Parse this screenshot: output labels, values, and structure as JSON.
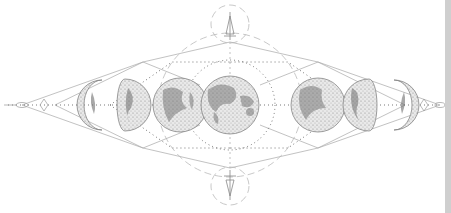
{
  "illustration": {
    "subject": "moon phases with sacred geometry",
    "colors": {
      "background": "#ffffff",
      "line": "#9a9a9a",
      "dots": "#555555",
      "moon_fill": "#e4e4e4",
      "moon_dark": "#6e6e6e",
      "moon_edge": "#777777",
      "edge_strip": "#cfcfcf"
    },
    "center_y": 105,
    "moons": [
      {
        "phase": "waxing-crescent",
        "cx": 96,
        "r": 25
      },
      {
        "phase": "first-quarter",
        "cx": 132,
        "r": 26
      },
      {
        "phase": "waxing-gibbous",
        "cx": 180,
        "r": 27
      },
      {
        "phase": "full-moon",
        "cx": 230,
        "r": 29
      },
      {
        "phase": "waning-gibbous",
        "cx": 318,
        "r": 27
      },
      {
        "phase": "last-quarter",
        "cx": 362,
        "r": 26
      },
      {
        "phase": "waning-crescent",
        "cx": 400,
        "r": 25
      }
    ]
  }
}
